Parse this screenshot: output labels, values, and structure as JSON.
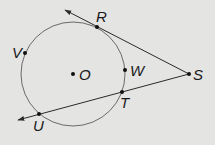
{
  "diagram": {
    "background": "#e4e4e3",
    "circle": {
      "center": "O",
      "cx": 73,
      "cy": 74,
      "r": 52
    },
    "points": [
      {
        "id": "R",
        "label": "R",
        "x": 97,
        "y": 27,
        "lx": 96,
        "ly": 22
      },
      {
        "id": "S",
        "label": "S",
        "x": 189,
        "y": 74,
        "lx": 193,
        "ly": 80
      },
      {
        "id": "T",
        "label": "T",
        "x": 122,
        "y": 92,
        "lx": 120,
        "ly": 108
      },
      {
        "id": "U",
        "label": "U",
        "x": 39,
        "y": 114,
        "lx": 33,
        "ly": 131
      },
      {
        "id": "W",
        "label": "W",
        "x": 125,
        "y": 70,
        "lx": 130,
        "ly": 76
      },
      {
        "id": "V",
        "label": "V",
        "x": 25,
        "y": 53,
        "lx": 12,
        "ly": 58
      },
      {
        "id": "O",
        "label": "O",
        "x": 73,
        "y": 74,
        "lx": 79,
        "ly": 80
      }
    ],
    "lines": [
      {
        "name": "tangent-line-SR",
        "from": "S",
        "to_arrow": [
          65,
          10
        ]
      },
      {
        "name": "secant-line-SU",
        "from": "S",
        "to_arrow": [
          18,
          120
        ]
      }
    ]
  }
}
